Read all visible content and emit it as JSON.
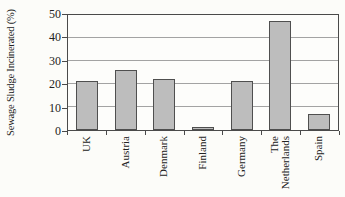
{
  "figure": {
    "background": "#fcfcf9",
    "axis_color": "#4a4a4a",
    "gridline_color": "#a3a3a3",
    "text_color": "#222222"
  },
  "chart_data": {
    "type": "bar",
    "title": "",
    "xlabel": "",
    "ylabel": "Sewage Sludge Incinerated (%)",
    "categories": [
      "UK",
      "Austria",
      "Denmark",
      "Finland",
      "Germany",
      "The Netherlands",
      "Spain"
    ],
    "values": [
      21.5,
      26,
      22,
      1.5,
      21.5,
      47.5,
      7
    ],
    "ylim": [
      0,
      50
    ],
    "yticks": [
      0,
      10,
      20,
      30,
      40,
      50
    ],
    "grid": true,
    "legend": false,
    "bar_fill": "#bdbdbd",
    "bar_border": "#4f4f4f"
  }
}
